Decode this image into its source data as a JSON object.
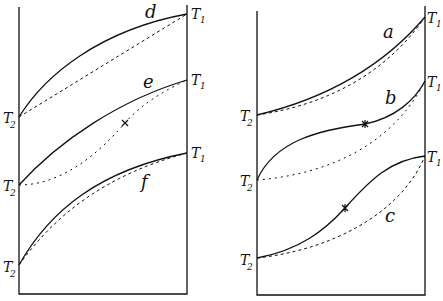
{
  "diagram": {
    "panels": [
      {
        "name": "left",
        "curves": [
          {
            "label": "d",
            "start": "T2",
            "end": "T1",
            "marker": false
          },
          {
            "label": "e",
            "start": "T2",
            "end": "T1",
            "marker": true
          },
          {
            "label": "f",
            "start": "T2",
            "end": "T1",
            "marker": false
          }
        ]
      },
      {
        "name": "right",
        "curves": [
          {
            "label": "a",
            "start": "T2",
            "end": "T1",
            "marker": false
          },
          {
            "label": "b",
            "start": "T2",
            "end": "T1",
            "marker": true
          },
          {
            "label": "c",
            "start": "T2",
            "end": "T1",
            "marker": true
          }
        ]
      }
    ],
    "labels": {
      "T": "T",
      "sub1": "1",
      "sub2": "2",
      "a": "a",
      "b": "b",
      "c": "c",
      "d": "d",
      "e": "e",
      "f": "f"
    },
    "colors": {
      "ink": "#111111",
      "background": "#ffffff"
    }
  }
}
